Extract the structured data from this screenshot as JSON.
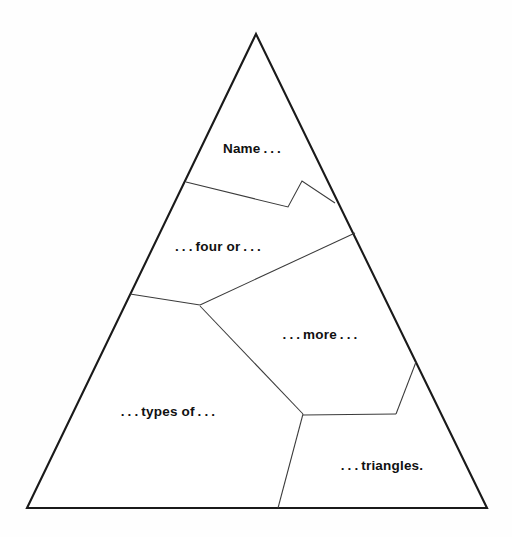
{
  "page": {
    "kind": "worksheet-diagram",
    "background_color": "#fefefe",
    "outline_color": "#1a1a1a",
    "divider_color": "#3b3b3b",
    "text_color": "#111111"
  },
  "figure": {
    "shape_name": "triangle",
    "apex": {
      "x": 256,
      "y": 34
    },
    "bottom_left": {
      "x": 27,
      "y": 508
    },
    "bottom_right": {
      "x": 487,
      "y": 508
    },
    "outline_points": "256,34 487,508 27,508",
    "dividers": [
      "M 186 182 L 288 207 L 302 181 L 335 203",
      "M 355 233 L 200 305",
      "M 130 294 L 200 305",
      "M 200 306 L 303 414",
      "M 303 415 L 396 414",
      "M 396 414 L 416 362",
      "M 303 414 L 278 508"
    ]
  },
  "regions": [
    {
      "id": "region-name",
      "label": "Name . . .",
      "x": 252,
      "y": 148
    },
    {
      "id": "region-four-or",
      "label": ". . . four or . . .",
      "x": 218,
      "y": 246
    },
    {
      "id": "region-more",
      "label": ". . . more . . .",
      "x": 320,
      "y": 334
    },
    {
      "id": "region-types-of",
      "label": ". . . types of . . .",
      "x": 168,
      "y": 411
    },
    {
      "id": "region-triangles",
      "label": ". . . triangles.",
      "x": 382,
      "y": 465
    }
  ],
  "prompt_sentence": "Name . . . four or . . . more . . . types of . . . triangles."
}
